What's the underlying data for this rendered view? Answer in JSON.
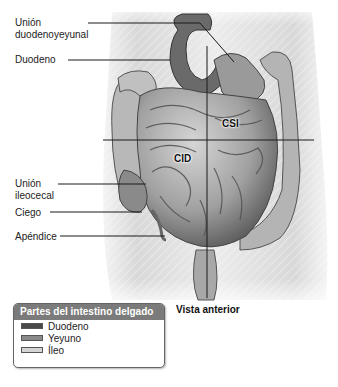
{
  "labels": {
    "union_duodenoyeyunal": [
      "Unión",
      "duodenoyeyunal"
    ],
    "duodeno": "Duodeno",
    "union_ileocecal": [
      "Unión",
      "ileocecal"
    ],
    "ciego": "Ciego",
    "apendice": "Apéndice"
  },
  "regions": {
    "csi": "CSI",
    "cid": "CID"
  },
  "view_label": "Vista anterior",
  "legend": {
    "title": "Partes del intestino delgado",
    "items": [
      {
        "label": "Duodeno",
        "color": "#4a4a4a"
      },
      {
        "label": "Yeyuno",
        "color": "#8a8a8a"
      },
      {
        "label": "Íleo",
        "color": "#d4d4d4"
      }
    ]
  },
  "colors": {
    "torso": "#e6e6e6",
    "intestine_dark": "#5e5e5e",
    "intestine_mid": "#9a9a9a",
    "intestine_light": "#c8c8c8",
    "line": "#1a1a1a"
  }
}
